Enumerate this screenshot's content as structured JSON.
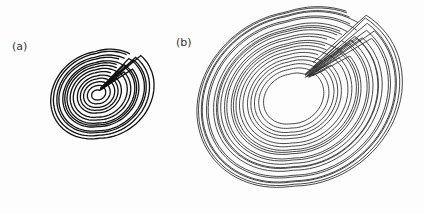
{
  "figure": {
    "panels": [
      {
        "label": "(a)",
        "label_pos": [
          12,
          40
        ],
        "attractor": {
          "type": "spiral-attractor",
          "center": [
            97,
            94
          ],
          "inner_radius": 4,
          "outer_radius": 48,
          "loops": 14,
          "tilt_deg": -35,
          "aspect": 0.86,
          "fold_side": "right",
          "stroke": "#111111",
          "stroke_width": 1.3
        }
      },
      {
        "label": "(b)",
        "label_pos": [
          176,
          36
        ],
        "attractor": {
          "type": "spiral-attractor",
          "center": [
            290,
            98
          ],
          "inner_radius": 26,
          "outer_radius": 100,
          "loops": 22,
          "tilt_deg": -35,
          "aspect": 0.86,
          "fold_side": "right",
          "stroke": "#333333",
          "stroke_width": 0.9
        }
      }
    ]
  }
}
